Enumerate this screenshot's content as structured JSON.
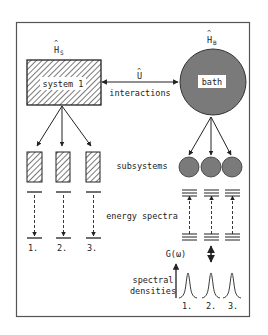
{
  "diagram": {
    "colors": {
      "frame": "#555555",
      "line": "#222222",
      "bath_fill": "#7a7a7a",
      "hatch": "#333333",
      "background": "#ffffff"
    },
    "system": {
      "hamiltonian_label": "H",
      "hamiltonian_sub": "S",
      "box_label": "system 1"
    },
    "bath": {
      "hamiltonian_label": "H",
      "hamiltonian_sub": "B",
      "circle_label": "bath"
    },
    "interaction": {
      "operator_label": "U",
      "label": "interactions"
    },
    "labels": {
      "subsystems": "subsystems",
      "energy_spectra": "energy spectra",
      "spectral_line1": "spectral",
      "spectral_line2": "densities",
      "g_omega": "G(ω)"
    },
    "system_indices": [
      "1.",
      "2.",
      "3."
    ],
    "bath_indices": [
      "1.",
      "2.",
      "3."
    ]
  }
}
